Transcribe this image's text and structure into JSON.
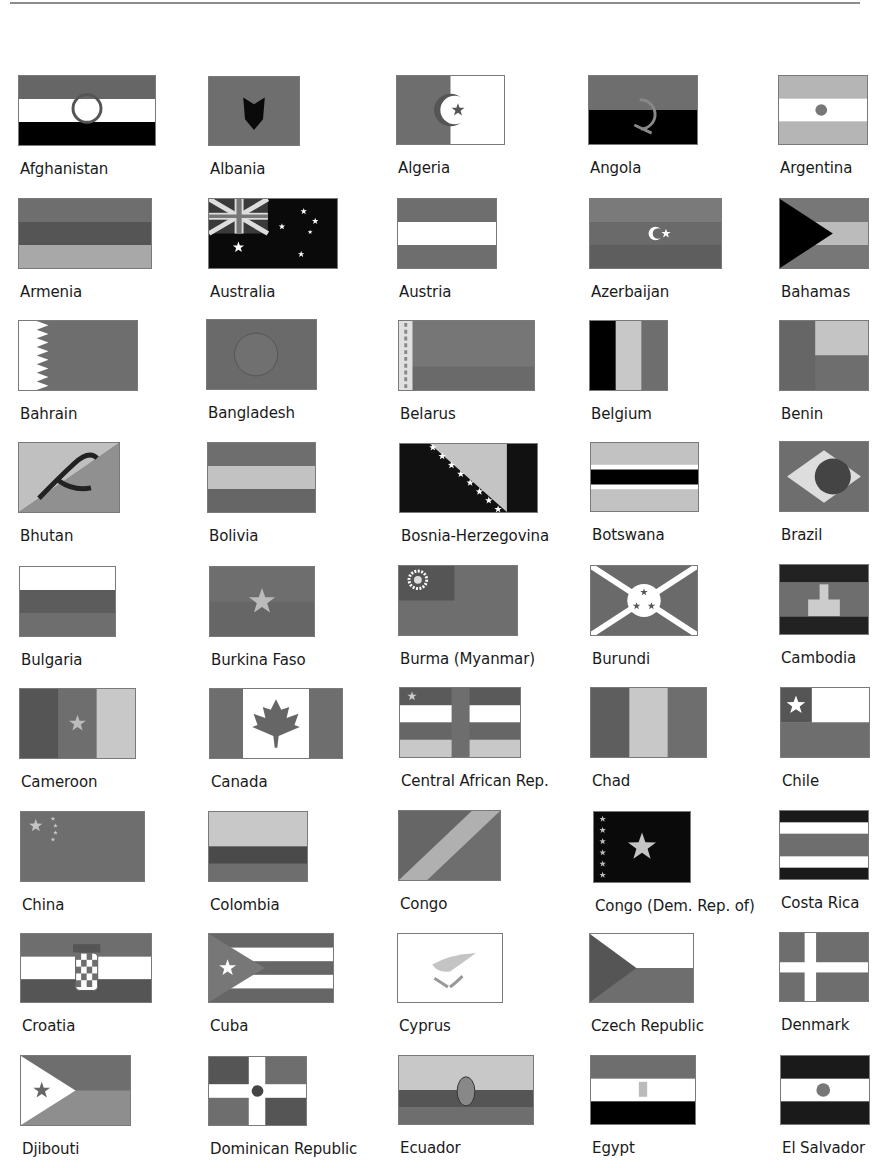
{
  "page": {
    "colors": {
      "dark": "#0a0a0a",
      "mid": "#6e6e6e",
      "midlight": "#8a8a8a",
      "light": "#c4c4c4",
      "white": "#ffffff"
    }
  },
  "flags": [
    {
      "name": "Afghanistan",
      "x": 18,
      "y": 75,
      "w": 138,
      "h": 71,
      "kind": "h3",
      "stripes": [
        "#666",
        "#fff",
        "#000"
      ],
      "emblem": "wreath"
    },
    {
      "name": "Albania",
      "x": 208,
      "y": 76,
      "w": 92,
      "h": 70,
      "kind": "solid",
      "fill": "#6e6e6e",
      "emblem": "eagle"
    },
    {
      "name": "Algeria",
      "x": 396,
      "y": 75,
      "w": 109,
      "h": 70,
      "kind": "v2",
      "stripes": [
        "#6e6e6e",
        "#fff"
      ],
      "emblem": "crescent-star"
    },
    {
      "name": "Angola",
      "x": 588,
      "y": 75,
      "w": 110,
      "h": 70,
      "kind": "h2",
      "stripes": [
        "#6e6e6e",
        "#000"
      ],
      "emblem": "machete"
    },
    {
      "name": "Argentina",
      "x": 778,
      "y": 75,
      "w": 90,
      "h": 70,
      "kind": "h3",
      "stripes": [
        "#b5b5b5",
        "#fff",
        "#b5b5b5"
      ],
      "emblem": "sun"
    },
    {
      "name": "Armenia",
      "x": 18,
      "y": 198,
      "w": 134,
      "h": 71,
      "kind": "h3",
      "stripes": [
        "#6e6e6e",
        "#555",
        "#a8a8a8"
      ]
    },
    {
      "name": "Australia",
      "x": 208,
      "y": 198,
      "w": 130,
      "h": 71,
      "kind": "australia"
    },
    {
      "name": "Austria",
      "x": 397,
      "y": 198,
      "w": 100,
      "h": 71,
      "kind": "h3",
      "stripes": [
        "#6e6e6e",
        "#fff",
        "#6e6e6e"
      ]
    },
    {
      "name": "Azerbaijan",
      "x": 589,
      "y": 198,
      "w": 133,
      "h": 71,
      "kind": "azerbaijan"
    },
    {
      "name": "Bahamas",
      "x": 779,
      "y": 198,
      "w": 90,
      "h": 71,
      "kind": "bahamas"
    },
    {
      "name": "Bahrain",
      "x": 18,
      "y": 320,
      "w": 120,
      "h": 71,
      "kind": "bahrain"
    },
    {
      "name": "Bangladesh",
      "x": 206,
      "y": 319,
      "w": 111,
      "h": 71,
      "kind": "bangladesh"
    },
    {
      "name": "Belarus",
      "x": 398,
      "y": 320,
      "w": 137,
      "h": 71,
      "kind": "belarus"
    },
    {
      "name": "Belgium",
      "x": 589,
      "y": 320,
      "w": 79,
      "h": 71,
      "kind": "v3",
      "stripes": [
        "#000",
        "#c8c8c8",
        "#6e6e6e"
      ]
    },
    {
      "name": "Benin",
      "x": 779,
      "y": 320,
      "w": 90,
      "h": 71,
      "kind": "benin"
    },
    {
      "name": "Bhutan",
      "x": 18,
      "y": 442,
      "w": 102,
      "h": 71,
      "kind": "bhutan"
    },
    {
      "name": "Bolivia",
      "x": 207,
      "y": 442,
      "w": 109,
      "h": 71,
      "kind": "h3",
      "stripes": [
        "#6e6e6e",
        "#c2c2c2",
        "#666"
      ]
    },
    {
      "name": "Bosnia-Herzegovina",
      "x": 399,
      "y": 443,
      "w": 139,
      "h": 70,
      "kind": "bosnia"
    },
    {
      "name": "Botswana",
      "x": 590,
      "y": 442,
      "w": 109,
      "h": 70,
      "kind": "botswana"
    },
    {
      "name": "Brazil",
      "x": 779,
      "y": 441,
      "w": 90,
      "h": 71,
      "kind": "brazil"
    },
    {
      "name": "Bulgaria",
      "x": 19,
      "y": 566,
      "w": 97,
      "h": 71,
      "kind": "h3",
      "stripes": [
        "#fff",
        "#5c5c5c",
        "#6e6e6e"
      ]
    },
    {
      "name": "Burkina Faso",
      "x": 209,
      "y": 566,
      "w": 106,
      "h": 71,
      "kind": "burkina"
    },
    {
      "name": "Burma (Myanmar)",
      "x": 398,
      "y": 565,
      "w": 120,
      "h": 71,
      "kind": "burma"
    },
    {
      "name": "Burundi",
      "x": 590,
      "y": 565,
      "w": 108,
      "h": 71,
      "kind": "burundi"
    },
    {
      "name": "Cambodia",
      "x": 779,
      "y": 564,
      "w": 90,
      "h": 71,
      "kind": "cambodia"
    },
    {
      "name": "Cameroon",
      "x": 19,
      "y": 688,
      "w": 117,
      "h": 71,
      "kind": "cameroon"
    },
    {
      "name": "Canada",
      "x": 209,
      "y": 688,
      "w": 134,
      "h": 71,
      "kind": "canada"
    },
    {
      "name": "Central African Rep.",
      "x": 399,
      "y": 687,
      "w": 122,
      "h": 71,
      "kind": "car"
    },
    {
      "name": "Chad",
      "x": 590,
      "y": 687,
      "w": 117,
      "h": 71,
      "kind": "v3",
      "stripes": [
        "#5e5e5e",
        "#c8c8c8",
        "#6e6e6e"
      ]
    },
    {
      "name": "Chile",
      "x": 780,
      "y": 687,
      "w": 90,
      "h": 71,
      "kind": "chile"
    },
    {
      "name": "China",
      "x": 20,
      "y": 811,
      "w": 125,
      "h": 71,
      "kind": "china"
    },
    {
      "name": "Colombia",
      "x": 208,
      "y": 811,
      "w": 100,
      "h": 71,
      "kind": "colombia"
    },
    {
      "name": "Congo",
      "x": 398,
      "y": 810,
      "w": 103,
      "h": 71,
      "kind": "congo"
    },
    {
      "name": "Congo (Dem. Rep. of)",
      "x": 593,
      "y": 811,
      "w": 98,
      "h": 72,
      "kind": "drc"
    },
    {
      "name": "Costa Rica",
      "x": 779,
      "y": 810,
      "w": 90,
      "h": 70,
      "kind": "costarica"
    },
    {
      "name": "Croatia",
      "x": 20,
      "y": 933,
      "w": 132,
      "h": 70,
      "kind": "croatia"
    },
    {
      "name": "Cuba",
      "x": 208,
      "y": 933,
      "w": 126,
      "h": 70,
      "kind": "cuba"
    },
    {
      "name": "Cyprus",
      "x": 397,
      "y": 933,
      "w": 106,
      "h": 70,
      "kind": "cyprus"
    },
    {
      "name": "Czech Republic",
      "x": 589,
      "y": 933,
      "w": 105,
      "h": 70,
      "kind": "czech"
    },
    {
      "name": "Denmark",
      "x": 779,
      "y": 932,
      "w": 90,
      "h": 70,
      "kind": "denmark"
    },
    {
      "name": "Djibouti",
      "x": 20,
      "y": 1055,
      "w": 111,
      "h": 71,
      "kind": "djibouti"
    },
    {
      "name": "Dominican Republic",
      "x": 208,
      "y": 1056,
      "w": 99,
      "h": 70,
      "kind": "dominican"
    },
    {
      "name": "Ecuador",
      "x": 398,
      "y": 1055,
      "w": 136,
      "h": 70,
      "kind": "ecuador"
    },
    {
      "name": "Egypt",
      "x": 590,
      "y": 1055,
      "w": 106,
      "h": 70,
      "kind": "h3",
      "stripes": [
        "#6e6e6e",
        "#fff",
        "#000"
      ],
      "emblem": "eagle-small"
    },
    {
      "name": "El Salvador",
      "x": 780,
      "y": 1055,
      "w": 90,
      "h": 70,
      "kind": "h3",
      "stripes": [
        "#1a1a1a",
        "#fff",
        "#1a1a1a"
      ],
      "emblem": "seal"
    }
  ]
}
